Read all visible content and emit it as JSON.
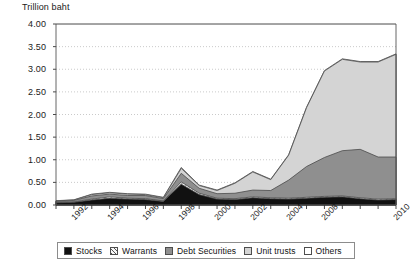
{
  "chart_data": {
    "type": "area",
    "stacked": true,
    "title": "Trillion baht",
    "xlabel": "",
    "ylabel": "Trillion baht",
    "ylim": [
      0.0,
      4.0
    ],
    "ytick_labels": [
      "0.00",
      "0.50",
      "1.00",
      "1.50",
      "2.00",
      "2.50",
      "3.00",
      "3.50",
      "4.00"
    ],
    "ytick_values": [
      0.0,
      0.5,
      1.0,
      1.5,
      2.0,
      2.5,
      3.0,
      3.5,
      4.0
    ],
    "grid": true,
    "grid_style": "dotted-horizontal",
    "legend_position": "bottom",
    "x": [
      1991,
      1992,
      1993,
      1994,
      1995,
      1996,
      1997,
      1998,
      1999,
      2000,
      2001,
      2002,
      2003,
      2004,
      2005,
      2006,
      2007,
      2008,
      2009,
      2010
    ],
    "xtick_labels": [
      "1992",
      "1994",
      "1996",
      "1998",
      "2000",
      "2002",
      "2004",
      "2008",
      "2010"
    ],
    "xtick_values": [
      1992,
      1994,
      1996,
      1998,
      2000,
      2002,
      2004,
      2006,
      2010
    ],
    "series": [
      {
        "name": "Stocks",
        "color": "#111111",
        "pattern": "solid",
        "values": [
          0.05,
          0.06,
          0.11,
          0.15,
          0.13,
          0.12,
          0.08,
          0.46,
          0.23,
          0.13,
          0.12,
          0.16,
          0.14,
          0.13,
          0.15,
          0.17,
          0.18,
          0.14,
          0.11,
          0.12
        ]
      },
      {
        "name": "Warrants",
        "color": "#f2f2f2",
        "pattern": "hatched",
        "values": [
          0.01,
          0.01,
          0.02,
          0.03,
          0.02,
          0.02,
          0.01,
          0.05,
          0.03,
          0.02,
          0.02,
          0.02,
          0.02,
          0.02,
          0.02,
          0.02,
          0.02,
          0.02,
          0.02,
          0.02
        ]
      },
      {
        "name": "Debt Securities",
        "color": "#8f8f8f",
        "pattern": "solid",
        "values": [
          0.02,
          0.03,
          0.07,
          0.06,
          0.06,
          0.07,
          0.05,
          0.19,
          0.11,
          0.1,
          0.12,
          0.15,
          0.16,
          0.4,
          0.68,
          0.86,
          1.0,
          1.07,
          0.93,
          0.92
        ]
      },
      {
        "name": "Unit trusts",
        "color": "#d4d4d4",
        "pattern": "solid",
        "values": [
          0.01,
          0.01,
          0.03,
          0.03,
          0.03,
          0.02,
          0.02,
          0.11,
          0.06,
          0.07,
          0.22,
          0.4,
          0.24,
          0.55,
          1.3,
          1.91,
          2.02,
          1.93,
          2.1,
          2.27
        ]
      },
      {
        "name": "Others",
        "color": "#ffffff",
        "pattern": "solid",
        "values": [
          0.005,
          0.005,
          0.01,
          0.01,
          0.01,
          0.01,
          0.01,
          0.02,
          0.01,
          0.01,
          0.01,
          0.01,
          0.01,
          0.01,
          0.01,
          0.01,
          0.01,
          0.01,
          0.01,
          0.01
        ]
      }
    ],
    "totals": [
      0.095,
      0.115,
      0.24,
      0.28,
      0.25,
      0.24,
      0.17,
      0.83,
      0.44,
      0.33,
      0.49,
      0.74,
      0.57,
      1.11,
      2.16,
      2.97,
      3.23,
      3.17,
      3.17,
      3.34
    ]
  },
  "legend": {
    "entries": [
      {
        "label": "Stocks"
      },
      {
        "label": "Warrants"
      },
      {
        "label": "Debt Securities"
      },
      {
        "label": "Unit trusts"
      },
      {
        "label": "Others"
      }
    ]
  }
}
